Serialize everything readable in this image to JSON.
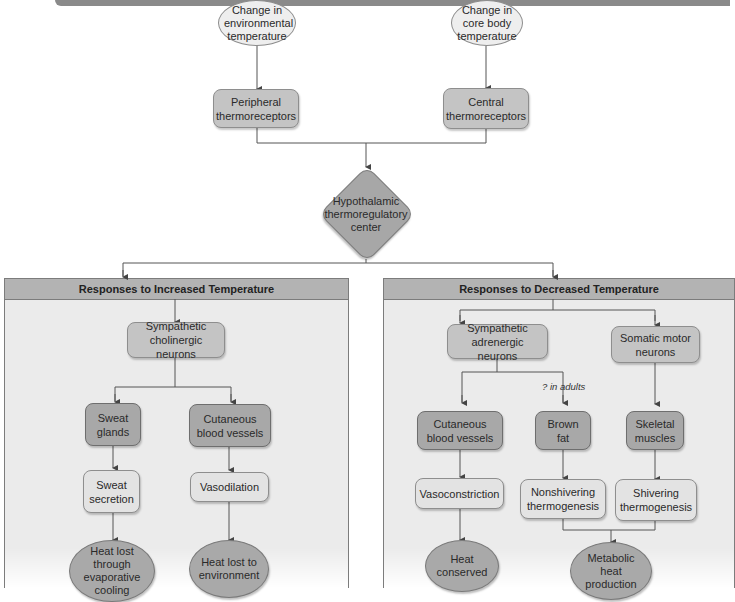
{
  "diagram": {
    "inputs": {
      "environmental": "Change in environmental temperature",
      "core": "Change in core body temperature"
    },
    "receptors": {
      "peripheral": "Peripheral thermoreceptors",
      "central": "Central thermoreceptors"
    },
    "center": "Hypothalamic thermoregulatory center",
    "increased": {
      "header": "Responses to Increased Temperature",
      "effector_neurons": "Sympathetic cholinergic neurons",
      "sweat_glands": "Sweat glands",
      "cutaneous_vessels": "Cutaneous blood vessels",
      "sweat_secretion": "Sweat secretion",
      "vasodilation": "Vasodilation",
      "outcome_evaporative": "Heat lost through evaporative cooling",
      "outcome_environment": "Heat lost to environment"
    },
    "decreased": {
      "header": "Responses to Decreased Temperature",
      "adrenergic_neurons": "Sympathetic adrenergic neurons",
      "motor_neurons": "Somatic motor neurons",
      "annotation": "? in adults",
      "cutaneous_vessels": "Cutaneous blood vessels",
      "brown_fat": "Brown fat",
      "skeletal_muscles": "Skeletal muscles",
      "vasoconstriction": "Vasoconstriction",
      "nonshivering": "Nonshivering thermogenesis",
      "shivering": "Shivering thermogenesis",
      "outcome_conserved": "Heat conserved",
      "outcome_metabolic": "Metabolic heat production"
    }
  },
  "colors": {
    "banner": "#8a8a8a",
    "panel_bg": "#ebebeb",
    "panel_header": "#b3b3b3",
    "node_dark": "#a8a8a8",
    "node_mid": "#c4c4c4",
    "node_light": "#e3e3e3",
    "line": "#555555"
  }
}
